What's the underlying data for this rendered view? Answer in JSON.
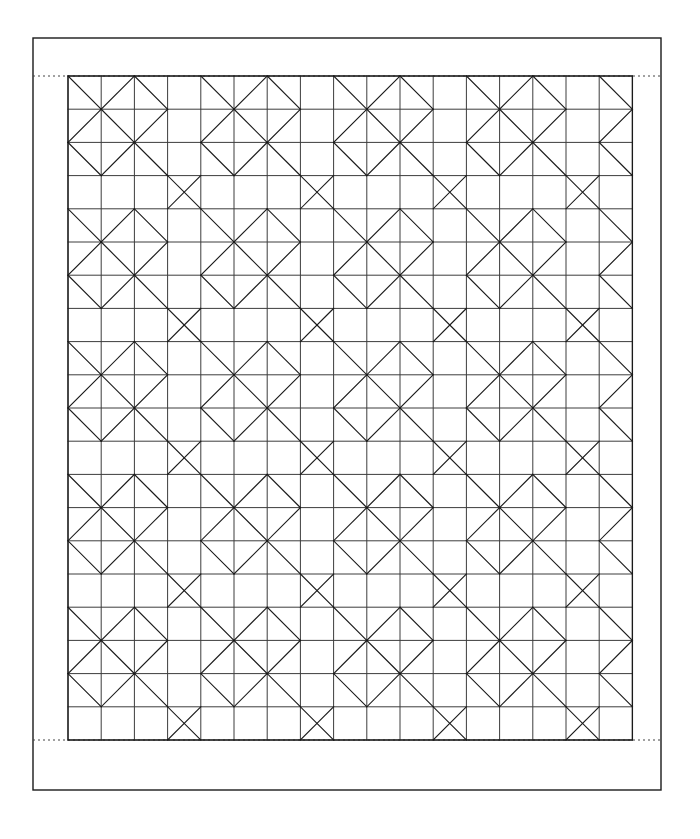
{
  "figure": {
    "background_color": "#ffffff",
    "line_color": "#1a1a1a",
    "grid_line_color": "#3c3c3c",
    "diagonal_line_color": "#1a1a1a"
  },
  "frame": {
    "name": "outer-border",
    "x": 33,
    "y": 38,
    "width": 628,
    "height": 752,
    "stroke_width": 1.4,
    "color": "#1a1a1a"
  },
  "grid": {
    "name": "pattern-grid",
    "origin_x": 68,
    "origin_y": 76,
    "cell_size": 33.2,
    "columns": 17,
    "rows": 20,
    "width": 564.4,
    "height": 664,
    "stroke_width": 1.0,
    "color": "#3c3c3c"
  },
  "guides": [
    {
      "name": "top-registration-guide",
      "y": 76,
      "x1": 33,
      "x2": 661,
      "style": "dotted",
      "color": "#444444"
    },
    {
      "name": "bottom-registration-guide",
      "y": 740,
      "x1": 33,
      "x2": 661,
      "style": "dotted",
      "color": "#444444"
    }
  ],
  "motif": {
    "period_x": 4,
    "period_y": 4,
    "description": "Each 4x4 block of cells carries a fixed set of cell diagonals; the block repeats across the whole grid.",
    "cell_diagonals": [
      [
        "b",
        "f",
        "b",
        "n"
      ],
      [
        "f",
        "b",
        "f",
        "n"
      ],
      [
        "b",
        "f",
        "b",
        "n"
      ],
      [
        "n",
        "n",
        "n",
        "x"
      ]
    ],
    "diagonal_codes": {
      "f": "forward diagonal (bottom-left to top-right)",
      "b": "backward diagonal (top-left to bottom-right)",
      "x": "both diagonals (full cross)",
      "n": "no diagonal"
    }
  },
  "chart_data": {
    "type": "diagram",
    "columns": 17,
    "rows": 20,
    "cell_size_px": 33.2,
    "total_cells": 340
  }
}
